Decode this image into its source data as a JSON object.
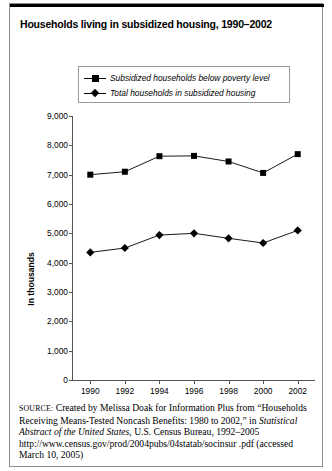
{
  "figure": {
    "title": "Households living in subsidized housing, 1990–2002"
  },
  "legend": {
    "items": [
      {
        "label": "Subsidized households below poverty level",
        "marker": "square-marker",
        "color": "#000000"
      },
      {
        "label": "Total households in subsidized housing",
        "marker": "diamond-marker",
        "color": "#000000"
      }
    ]
  },
  "axes": {
    "ylabel": "In thousands",
    "yticks": [
      "0",
      "1,000",
      "2,000",
      "3,000",
      "4,000",
      "5,000",
      "6,000",
      "7,000",
      "8,000",
      "9,000"
    ],
    "xticks": [
      "1990",
      "1992",
      "1994",
      "1996",
      "1998",
      "2000",
      "2002"
    ]
  },
  "source": {
    "label": "SOURCE:",
    "line1": " Created by Melissa Doak for Information Plus from “Households Receiving Means-Tested Noncash Benefits: 1980 to 2002,” in ",
    "italic1": "Statistical Abstract of the United States",
    "line2": ", U.S. Census Bureau, 1992–2005 http://www.census.gov/prod/2004pubs/04statab/socinsur .pdf (accessed March 10, 2005)"
  },
  "chart_data": {
    "type": "line",
    "title": "Households living in subsidized housing, 1990–2002",
    "xlabel": "",
    "ylabel": "In thousands",
    "categories": [
      1990,
      1992,
      1994,
      1996,
      1998,
      2000,
      2002
    ],
    "series": [
      {
        "name": "Subsidized households below poverty level",
        "marker": "square",
        "color": "#000000",
        "values": [
          7000,
          7100,
          7630,
          7640,
          7450,
          7060,
          7700
        ]
      },
      {
        "name": "Total households in subsidized housing",
        "marker": "diamond",
        "color": "#000000",
        "values": [
          4350,
          4500,
          4940,
          5000,
          4830,
          4670,
          5100
        ]
      }
    ],
    "ylim": [
      0,
      9000
    ],
    "ytick_step": 1000,
    "xlim": [
      1989,
      2003
    ],
    "grid": false,
    "legend_position": "top-center"
  }
}
